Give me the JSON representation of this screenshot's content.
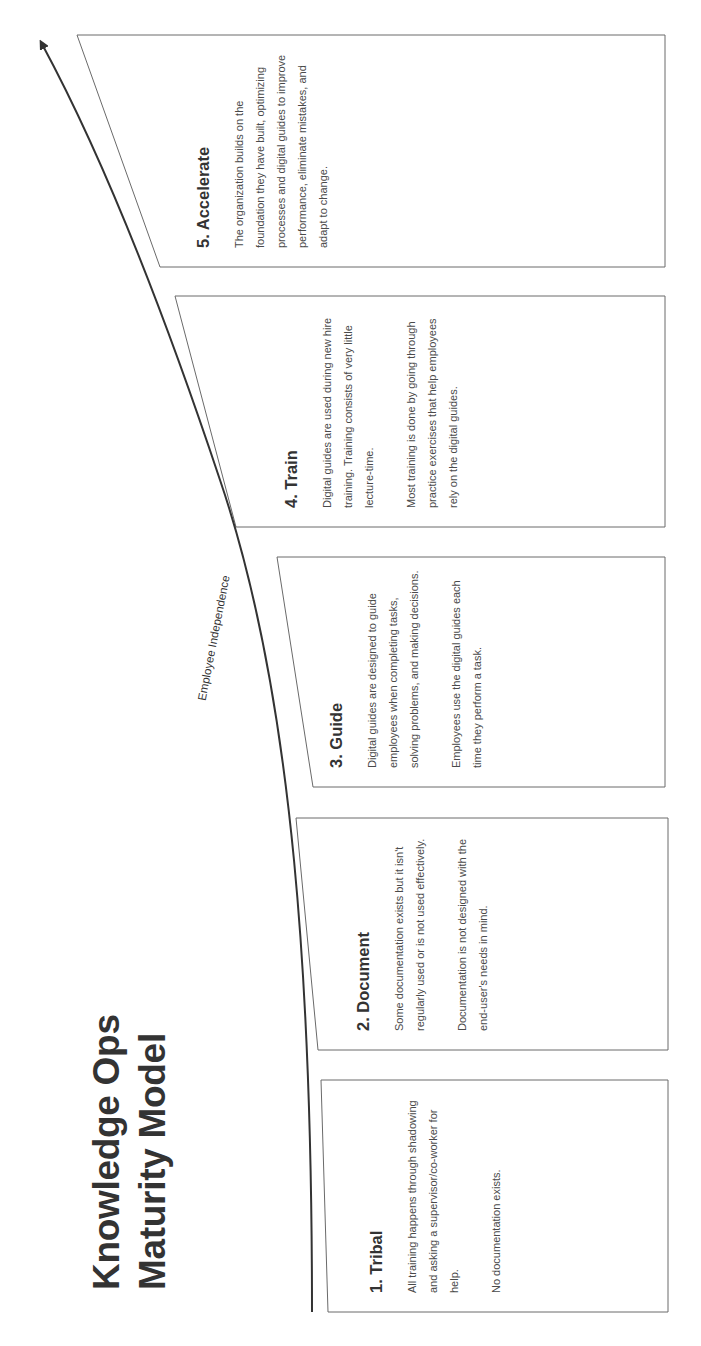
{
  "title": {
    "line1": "Knowledge Ops",
    "line2": "Maturity Model"
  },
  "axis": {
    "label": "Employee Independence",
    "icon": "arrow-up-curve"
  },
  "stages": [
    {
      "number": 1,
      "title": "1. Tribal",
      "paragraphs": [
        "All training happens through shadowing and asking a supervisor/co-worker for help.",
        "No documentation exists."
      ]
    },
    {
      "number": 2,
      "title": "2. Document",
      "paragraphs": [
        "Some documentation exists but it isn't regularly used or is not used effectively.",
        "Documentation is not designed with the end-user's needs in mind."
      ]
    },
    {
      "number": 3,
      "title": "3. Guide",
      "paragraphs": [
        "Digital guides are designed to guide employees when completing tasks, solving problems, and making decisions.",
        "Employees use the digital guides each time they perform a task."
      ]
    },
    {
      "number": 4,
      "title": "4. Train",
      "paragraphs": [
        "Digital guides are used during new hire training. Training consists of very little lecture-time.",
        "Most training is done by going through practice exercises that help employees rely on the digital guides."
      ]
    },
    {
      "number": 5,
      "title": "5. Accelerate",
      "paragraphs": [
        "The organization builds on the foundation they have built, optimizing processes and digital guides to improve performance, eliminate mistakes, and adapt to change."
      ]
    }
  ],
  "colors": {
    "line": "#333333",
    "border": "#6a6a6a",
    "text": "#4a4a4a"
  }
}
